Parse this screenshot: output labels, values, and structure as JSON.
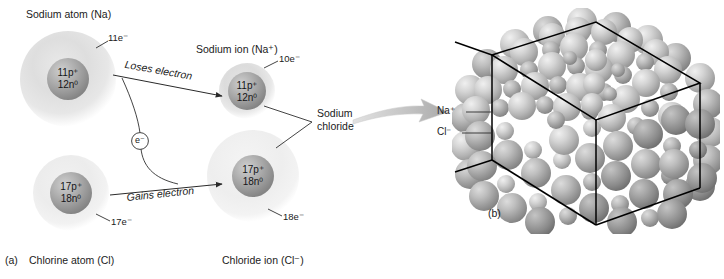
{
  "figure": {
    "panel_a_marker": "(a)",
    "panel_b_marker": "(b)"
  },
  "panel_a": {
    "sodium_atom": {
      "title": "Sodium atom (Na)",
      "electron_label": "11e⁻",
      "nucleus_protons": "11p⁺",
      "nucleus_neutrons": "12n⁰"
    },
    "chlorine_atom": {
      "title": "Chlorine atom (Cl)",
      "electron_label": "17e⁻",
      "nucleus_protons": "17p⁺",
      "nucleus_neutrons": "18n⁰"
    },
    "sodium_ion": {
      "title": "Sodium ion (Na⁺)",
      "electron_label": "10e⁻",
      "nucleus_protons": "11p⁺",
      "nucleus_neutrons": "12n⁰"
    },
    "chloride_ion": {
      "title": "Chloride ion (Cl⁻)",
      "electron_label": "18e⁻",
      "nucleus_protons": "17p⁺",
      "nucleus_neutrons": "18n⁰"
    },
    "arrow_top_label": "Loses electron",
    "arrow_bottom_label": "Gains electron",
    "electron_token": "e⁻",
    "product_label_line1": "Sodium",
    "product_label_line2": "chloride"
  },
  "panel_b": {
    "sodium_ion_label": "Na⁺",
    "chloride_ion_label": "Cl⁻"
  },
  "colors": {
    "background": "#ffffff",
    "ink": "#1b1b1b",
    "cube_edge": "#000000",
    "nucleus_dark": "#8d8d8d",
    "nucleus_light": "#c9c9c9",
    "cloud_gray": "#d8d8d8",
    "cloud_light": "#eeeeee",
    "big_arrow": "#b6b6b6",
    "sphere_light": "#d2d2d2",
    "sphere_dark": "#8a8a8a"
  }
}
